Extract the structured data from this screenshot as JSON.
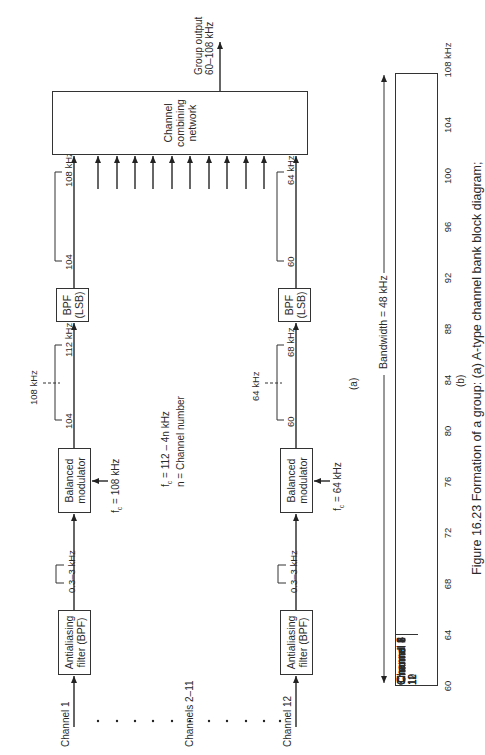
{
  "figure": {
    "caption": "Figure 16.23  Formation of a group: (a) A-type channel bank block diagram;",
    "panel_a_label": "(a)",
    "panel_b_label": "(b)"
  },
  "block_diagram": {
    "channel_1": {
      "input_label": "Channel 1",
      "antialiasing_filter": "Antialiasing filter (BPF)",
      "antialiasing_line1": "Antialiasing",
      "antialiasing_line2": "filter (BPF)",
      "baseband_band": "0.3–3 kHz",
      "modulator_line1": "Balanced",
      "modulator_line2": "modulator",
      "carrier": "fc = 108 kHz",
      "carrier_prefix": "f",
      "carrier_sub": "c",
      "carrier_value": " = 108 kHz",
      "dsb_low": "104",
      "dsb_high": "112 kHz",
      "dsb_center": "108 kHz",
      "bpf_line1": "BPF",
      "bpf_line2": "(LSB)",
      "lsb_low": "104",
      "lsb_high": "108 kHz"
    },
    "channels_middle_label": "Channels 2–11",
    "formula_line1_prefix": "f",
    "formula_line1_sub": "c",
    "formula_line1_rest": " = 112 – 4n kHz",
    "formula_line2": "n = Channel number",
    "channel_12": {
      "input_label": "Channel 12",
      "antialiasing_line1": "Antialiasing",
      "antialiasing_line2": "filter (BPF)",
      "baseband_band": "0.3–3 kHz",
      "modulator_line1": "Balanced",
      "modulator_line2": "modulator",
      "carrier_prefix": "f",
      "carrier_sub": "c",
      "carrier_value": " = 64 kHz",
      "dsb_low": "60",
      "dsb_high": "68 kHz",
      "dsb_center": "64 kHz",
      "bpf_line1": "BPF",
      "bpf_line2": "(LSB)",
      "lsb_low": "60",
      "lsb_high": "64 kHz"
    },
    "combiner_line1": "Channel",
    "combiner_line2": "combining",
    "combiner_line3": "network",
    "output_line1": "Group output",
    "output_line2": "60–108 kHz"
  },
  "spectrum": {
    "bandwidth_label": "Bandwidth = 48 kHz",
    "channels": [
      "Channel 12",
      "Channel 11",
      "Channel 10",
      "Channel 9",
      "Channel 8",
      "Channel 7",
      "Channel 6",
      "Channel 5",
      "Channel 4",
      "Channel 3",
      "Channel 2",
      "Channel 1"
    ],
    "ticks": [
      "60",
      "64",
      "68",
      "72",
      "76",
      "80",
      "84",
      "88",
      "92",
      "96",
      "100",
      "104",
      "108 kHz"
    ]
  }
}
